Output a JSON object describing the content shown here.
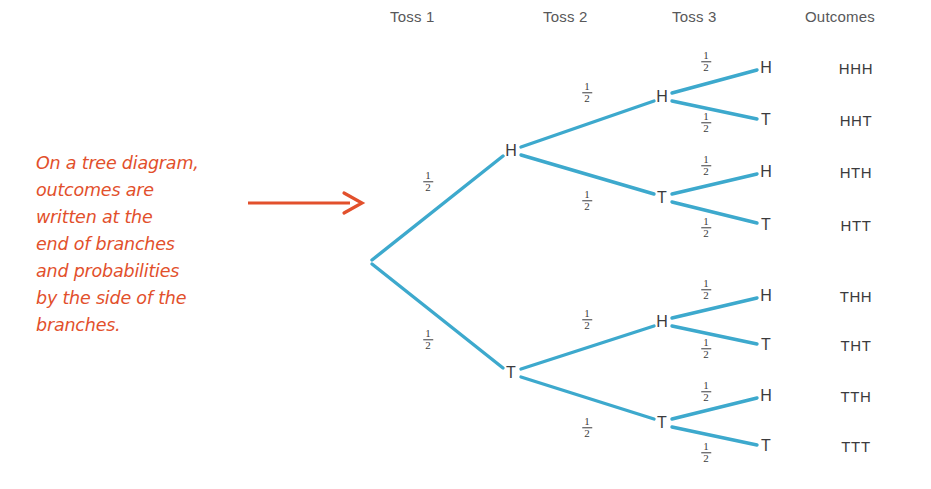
{
  "columns": {
    "headers": [
      {
        "label": "Toss 1",
        "x": 390,
        "y": 8
      },
      {
        "label": "Toss 2",
        "x": 543,
        "y": 8
      },
      {
        "label": "Toss 3",
        "x": 672,
        "y": 8
      },
      {
        "label": "Outcomes",
        "x": 805,
        "y": 8
      }
    ]
  },
  "annotation": {
    "color": "#e2502c",
    "lines": [
      "On a tree diagram,",
      "outcomes are",
      "written at the",
      "end of branches",
      "and probabilities",
      "by the side of the",
      "branches."
    ],
    "arrow_label": "right-arrow"
  },
  "tree": {
    "branch_color": "#3da9cd",
    "root": {
      "x": 370,
      "y": 262
    },
    "nodes": [
      {
        "id": "H1",
        "label": "H",
        "x": 511,
        "y": 151,
        "level": 1
      },
      {
        "id": "T1",
        "label": "T",
        "x": 511,
        "y": 373,
        "level": 1
      },
      {
        "id": "H2a",
        "label": "H",
        "x": 662,
        "y": 97,
        "level": 2
      },
      {
        "id": "T2a",
        "label": "T",
        "x": 662,
        "y": 198,
        "level": 2
      },
      {
        "id": "H2b",
        "label": "H",
        "x": 662,
        "y": 322,
        "level": 2
      },
      {
        "id": "T2b",
        "label": "T",
        "x": 662,
        "y": 423,
        "level": 2
      },
      {
        "id": "L1",
        "label": "H",
        "x": 766,
        "y": 68,
        "level": 3
      },
      {
        "id": "L2",
        "label": "T",
        "x": 766,
        "y": 120,
        "level": 3
      },
      {
        "id": "L3",
        "label": "H",
        "x": 766,
        "y": 172,
        "level": 3
      },
      {
        "id": "L4",
        "label": "T",
        "x": 766,
        "y": 225,
        "level": 3
      },
      {
        "id": "L5",
        "label": "H",
        "x": 766,
        "y": 296,
        "level": 3
      },
      {
        "id": "L6",
        "label": "T",
        "x": 766,
        "y": 345,
        "level": 3
      },
      {
        "id": "L7",
        "label": "H",
        "x": 766,
        "y": 396,
        "level": 3
      },
      {
        "id": "L8",
        "label": "T",
        "x": 766,
        "y": 446,
        "level": 3
      }
    ],
    "edges": [
      {
        "from": "root",
        "to": "H1",
        "x1": 372,
        "y1": 260,
        "x2": 503,
        "y2": 156
      },
      {
        "from": "root",
        "to": "T1",
        "x1": 372,
        "y1": 264,
        "x2": 503,
        "y2": 368
      },
      {
        "from": "H1",
        "to": "H2a",
        "x1": 521,
        "y1": 147,
        "x2": 654,
        "y2": 101
      },
      {
        "from": "H1",
        "to": "T2a",
        "x1": 521,
        "y1": 155,
        "x2": 654,
        "y2": 194
      },
      {
        "from": "T1",
        "to": "H2b",
        "x1": 521,
        "y1": 369,
        "x2": 654,
        "y2": 326
      },
      {
        "from": "T1",
        "to": "T2b",
        "x1": 521,
        "y1": 377,
        "x2": 654,
        "y2": 419
      },
      {
        "from": "H2a",
        "to": "L1",
        "x1": 672,
        "y1": 93,
        "x2": 757,
        "y2": 70
      },
      {
        "from": "H2a",
        "to": "L2",
        "x1": 672,
        "y1": 101,
        "x2": 757,
        "y2": 119
      },
      {
        "from": "T2a",
        "to": "L3",
        "x1": 672,
        "y1": 194,
        "x2": 757,
        "y2": 174
      },
      {
        "from": "T2a",
        "to": "L4",
        "x1": 672,
        "y1": 202,
        "x2": 757,
        "y2": 223
      },
      {
        "from": "H2b",
        "to": "L5",
        "x1": 672,
        "y1": 318,
        "x2": 757,
        "y2": 298
      },
      {
        "from": "H2b",
        "to": "L6",
        "x1": 672,
        "y1": 326,
        "x2": 757,
        "y2": 344
      },
      {
        "from": "T2b",
        "to": "L7",
        "x1": 672,
        "y1": 419,
        "x2": 757,
        "y2": 398
      },
      {
        "from": "T2b",
        "to": "L8",
        "x1": 672,
        "y1": 427,
        "x2": 757,
        "y2": 445
      }
    ],
    "probabilities": [
      {
        "numerator": "1",
        "denominator": "2",
        "x": 428,
        "y": 182,
        "edge": "root-H1"
      },
      {
        "numerator": "1",
        "denominator": "2",
        "x": 428,
        "y": 340,
        "edge": "root-T1"
      },
      {
        "numerator": "1",
        "denominator": "2",
        "x": 587,
        "y": 93,
        "edge": "H1-H2a"
      },
      {
        "numerator": "1",
        "denominator": "2",
        "x": 587,
        "y": 201,
        "edge": "H1-T2a"
      },
      {
        "numerator": "1",
        "denominator": "2",
        "x": 587,
        "y": 320,
        "edge": "T1-H2b"
      },
      {
        "numerator": "1",
        "denominator": "2",
        "x": 587,
        "y": 428,
        "edge": "T1-T2b"
      },
      {
        "numerator": "1",
        "denominator": "2",
        "x": 706,
        "y": 62,
        "edge": "H2a-L1"
      },
      {
        "numerator": "1",
        "denominator": "2",
        "x": 706,
        "y": 123,
        "edge": "H2a-L2"
      },
      {
        "numerator": "1",
        "denominator": "2",
        "x": 706,
        "y": 166,
        "edge": "T2a-L3"
      },
      {
        "numerator": "1",
        "denominator": "2",
        "x": 706,
        "y": 228,
        "edge": "T2a-L4"
      },
      {
        "numerator": "1",
        "denominator": "2",
        "x": 706,
        "y": 290,
        "edge": "H2b-L5"
      },
      {
        "numerator": "1",
        "denominator": "2",
        "x": 706,
        "y": 349,
        "edge": "H2b-L6"
      },
      {
        "numerator": "1",
        "denominator": "2",
        "x": 706,
        "y": 392,
        "edge": "T2b-L7"
      },
      {
        "numerator": "1",
        "denominator": "2",
        "x": 706,
        "y": 453,
        "edge": "T2b-L8"
      }
    ],
    "outcomes": [
      {
        "label": "HHH",
        "x": 856,
        "y": 68
      },
      {
        "label": "HHT",
        "x": 856,
        "y": 120
      },
      {
        "label": "HTH",
        "x": 856,
        "y": 172
      },
      {
        "label": "HTT",
        "x": 856,
        "y": 225
      },
      {
        "label": "THH",
        "x": 856,
        "y": 296
      },
      {
        "label": "THT",
        "x": 856,
        "y": 345
      },
      {
        "label": "TTH",
        "x": 856,
        "y": 396
      },
      {
        "label": "TTT",
        "x": 856,
        "y": 446
      }
    ]
  }
}
